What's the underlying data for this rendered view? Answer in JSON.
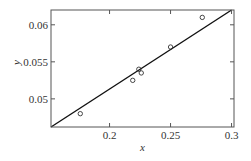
{
  "chart_data": {
    "type": "scatter",
    "title": "",
    "xlabel": "x",
    "ylabel": "y",
    "xlim": [
      0.152,
      0.302
    ],
    "ylim": [
      0.0462,
      0.062
    ],
    "grid": false,
    "legend": null,
    "x_ticks": [
      0.2,
      0.25,
      0.3
    ],
    "x_tick_labels": [
      "0.2",
      "0.25",
      "0.3"
    ],
    "y_ticks": [
      0.05,
      0.055,
      0.06
    ],
    "y_tick_labels": [
      "0.05",
      "0.055",
      "0.06"
    ],
    "series": [
      {
        "name": "data",
        "type": "scatter",
        "marker": "open-circle",
        "x": [
          0.176,
          0.219,
          0.224,
          0.226,
          0.25,
          0.276
        ],
        "y": [
          0.048,
          0.0525,
          0.054,
          0.0535,
          0.057,
          0.061
        ]
      },
      {
        "name": "fit",
        "type": "line",
        "x": [
          0.152,
          0.3
        ],
        "y": [
          0.0462,
          0.062
        ]
      }
    ]
  }
}
